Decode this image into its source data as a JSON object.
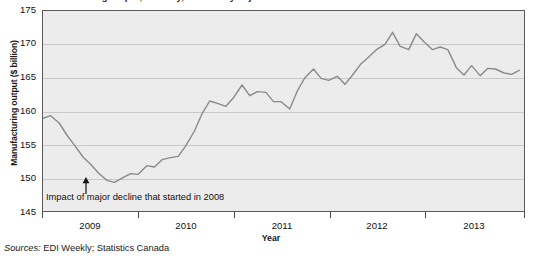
{
  "figure": {
    "title_clipped": "Manufacturing output, monthly, seasonally adjusted",
    "source_prefix": "Sources:",
    "source_text": " EDI Weekly; Statistics Canada"
  },
  "annotation": {
    "text": "Impact of major decline that started in 2008",
    "arrow_name": "up-arrow-annotation"
  },
  "colors": {
    "plot_background": "#ececed",
    "gridline": "#c9c9ca",
    "axis": "#5a5a5a",
    "series_line": "#8a8a8c",
    "text": "#111111"
  },
  "chart_data": {
    "type": "line",
    "title": "Manufacturing output, monthly, seasonally adjusted",
    "xlabel": "Year",
    "ylabel": "Manufacturing output ($ billion)",
    "ylim": [
      145,
      175
    ],
    "yticks": [
      145,
      150,
      155,
      160,
      165,
      170,
      175
    ],
    "xlim": [
      2008.62,
      2013.67
    ],
    "xticks": [
      2009,
      2010,
      2011,
      2012,
      2013
    ],
    "xtick_labels": [
      "2009",
      "2010",
      "2011",
      "2012",
      "2013"
    ],
    "xtick_label_positions": [
      2009.42,
      2010.42,
      2011.42,
      2012.42,
      2013.25
    ],
    "grid": true,
    "gridlines": "horizontal",
    "legend": false,
    "series": [
      {
        "name": "Manufacturing output",
        "x": [
          2008.62,
          2008.7,
          2008.79,
          2008.87,
          2008.96,
          2009.04,
          2009.12,
          2009.21,
          2009.29,
          2009.37,
          2009.46,
          2009.54,
          2009.62,
          2009.71,
          2009.79,
          2009.87,
          2009.96,
          2010.04,
          2010.12,
          2010.21,
          2010.29,
          2010.37,
          2010.46,
          2010.54,
          2010.62,
          2010.71,
          2010.79,
          2010.87,
          2010.96,
          2011.04,
          2011.12,
          2011.21,
          2011.29,
          2011.37,
          2011.46,
          2011.54,
          2011.62,
          2011.71,
          2011.79,
          2011.87,
          2011.96,
          2012.04,
          2012.12,
          2012.21,
          2012.29,
          2012.37,
          2012.46,
          2012.54,
          2012.62,
          2012.71,
          2012.79,
          2012.87,
          2012.96,
          2013.04,
          2013.12,
          2013.21,
          2013.29,
          2013.37,
          2013.46,
          2013.54,
          2013.62
        ],
        "values": [
          158.9,
          159.3,
          158.2,
          156.4,
          154.7,
          153.1,
          152.0,
          150.6,
          149.6,
          149.3,
          150.0,
          150.6,
          150.5,
          151.8,
          151.6,
          152.7,
          153.0,
          153.2,
          154.8,
          157.0,
          159.6,
          161.5,
          161.1,
          160.7,
          162.0,
          163.9,
          162.3,
          162.9,
          162.8,
          161.4,
          161.4,
          160.3,
          163.0,
          165.0,
          166.3,
          164.9,
          164.6,
          165.2,
          164.0,
          165.4,
          167.1,
          168.1,
          169.2,
          170.0,
          171.8,
          169.7,
          169.2,
          171.6,
          170.4,
          169.2,
          169.6,
          169.2,
          166.5,
          165.4,
          166.8,
          165.3,
          166.4,
          166.3,
          165.7,
          165.5,
          166.1
        ]
      }
    ],
    "annotations": [
      {
        "text": "Impact of major decline that started in 2008",
        "points_to": {
          "x": 2009.37,
          "y": 149.3
        }
      }
    ]
  }
}
